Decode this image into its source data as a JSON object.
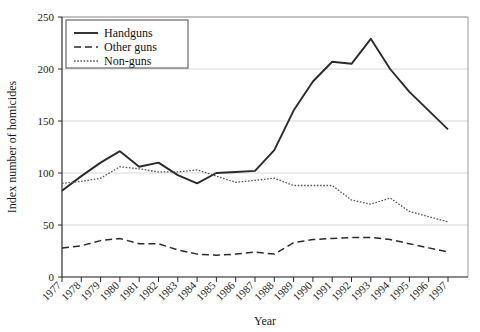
{
  "chart_data": {
    "type": "line",
    "title": "",
    "xlabel": "Year",
    "ylabel": "Index number of homicides",
    "x": [
      1977,
      1978,
      1979,
      1980,
      1981,
      1982,
      1983,
      1984,
      1985,
      1986,
      1987,
      1988,
      1989,
      1990,
      1991,
      1992,
      1993,
      1994,
      1995,
      1996,
      1997
    ],
    "categories": [
      "1977",
      "1978",
      "1979",
      "1980",
      "1981",
      "1982",
      "1983",
      "1984",
      "1985",
      "1986",
      "1987",
      "1988",
      "1989",
      "1990",
      "1991",
      "1992",
      "1993",
      "1994",
      "1995",
      "1996",
      "1997"
    ],
    "xlim": [
      1977,
      1997
    ],
    "ylim": [
      0,
      250
    ],
    "yticks": [
      0,
      50,
      100,
      150,
      200,
      250
    ],
    "ytick_labels": [
      "0",
      "50",
      "100",
      "150",
      "200",
      "250"
    ],
    "grid": true,
    "legend_position": "top-left",
    "series": [
      {
        "name": "Handguns",
        "style": "solid",
        "color": "#2b2b2b",
        "values": [
          83,
          97,
          110,
          121,
          106,
          110,
          98,
          90,
          100,
          101,
          102,
          122,
          160,
          188,
          207,
          205,
          229,
          200,
          178,
          160,
          142
        ]
      },
      {
        "name": "Other guns",
        "style": "dashed",
        "color": "#2b2b2b",
        "values": [
          28,
          30,
          35,
          37,
          32,
          32,
          26,
          22,
          21,
          22,
          24,
          22,
          33,
          36,
          37,
          38,
          38,
          36,
          32,
          28,
          24
        ]
      },
      {
        "name": "Non-guns",
        "style": "dotted",
        "color": "#555555",
        "values": [
          90,
          92,
          95,
          106,
          104,
          101,
          101,
          103,
          97,
          91,
          93,
          95,
          88,
          88,
          88,
          74,
          70,
          76,
          63,
          58,
          53
        ]
      }
    ]
  },
  "legend": {
    "entries": [
      {
        "label": "Handguns",
        "style": "solid"
      },
      {
        "label": "Other guns",
        "style": "dashed"
      },
      {
        "label": "Non-guns",
        "style": "dotted"
      }
    ]
  },
  "axes": {
    "x_title": "Year",
    "y_title": "Index number of homicides"
  }
}
